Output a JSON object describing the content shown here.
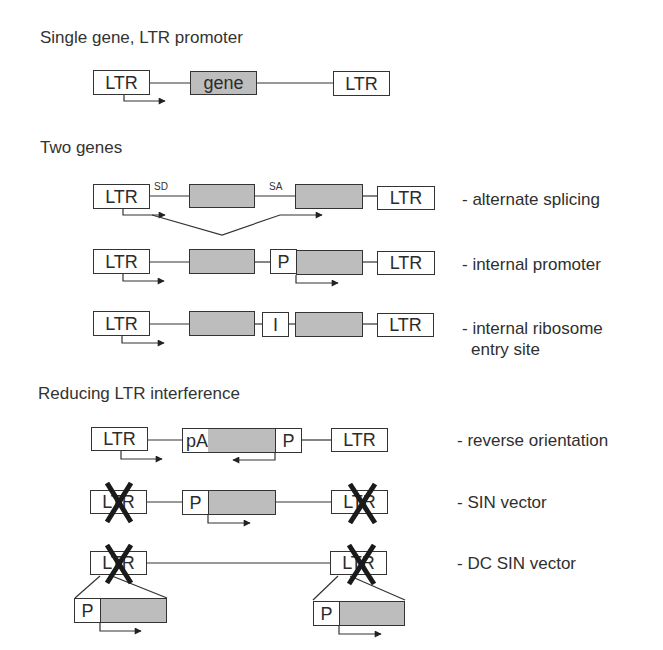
{
  "sections": [
    {
      "title": "Single gene, LTR promoter"
    },
    {
      "title": "Two genes"
    },
    {
      "title": "Reducing LTR interference"
    }
  ],
  "labels": {
    "ltr": "LTR",
    "gene": "gene",
    "promoter": "P",
    "ires": "I",
    "polyA": "pA",
    "splice_donor": "SD",
    "splice_acceptor": "SA"
  },
  "constructs": [
    {
      "id": "single-gene",
      "description": ""
    },
    {
      "id": "alternate-splicing",
      "description": "- alternate splicing"
    },
    {
      "id": "internal-promoter",
      "description": "- internal promoter"
    },
    {
      "id": "ires",
      "description": "- internal ribosome",
      "description_line2": "entry site"
    },
    {
      "id": "reverse-orientation",
      "description": "- reverse orientation"
    },
    {
      "id": "sin-vector",
      "description": "- SIN vector"
    },
    {
      "id": "dc-sin-vector",
      "description": "- DC SIN vector"
    }
  ],
  "colors": {
    "gene_fill": "#bdbdbd",
    "line": "#333333",
    "cross": "#1a1a1a"
  }
}
